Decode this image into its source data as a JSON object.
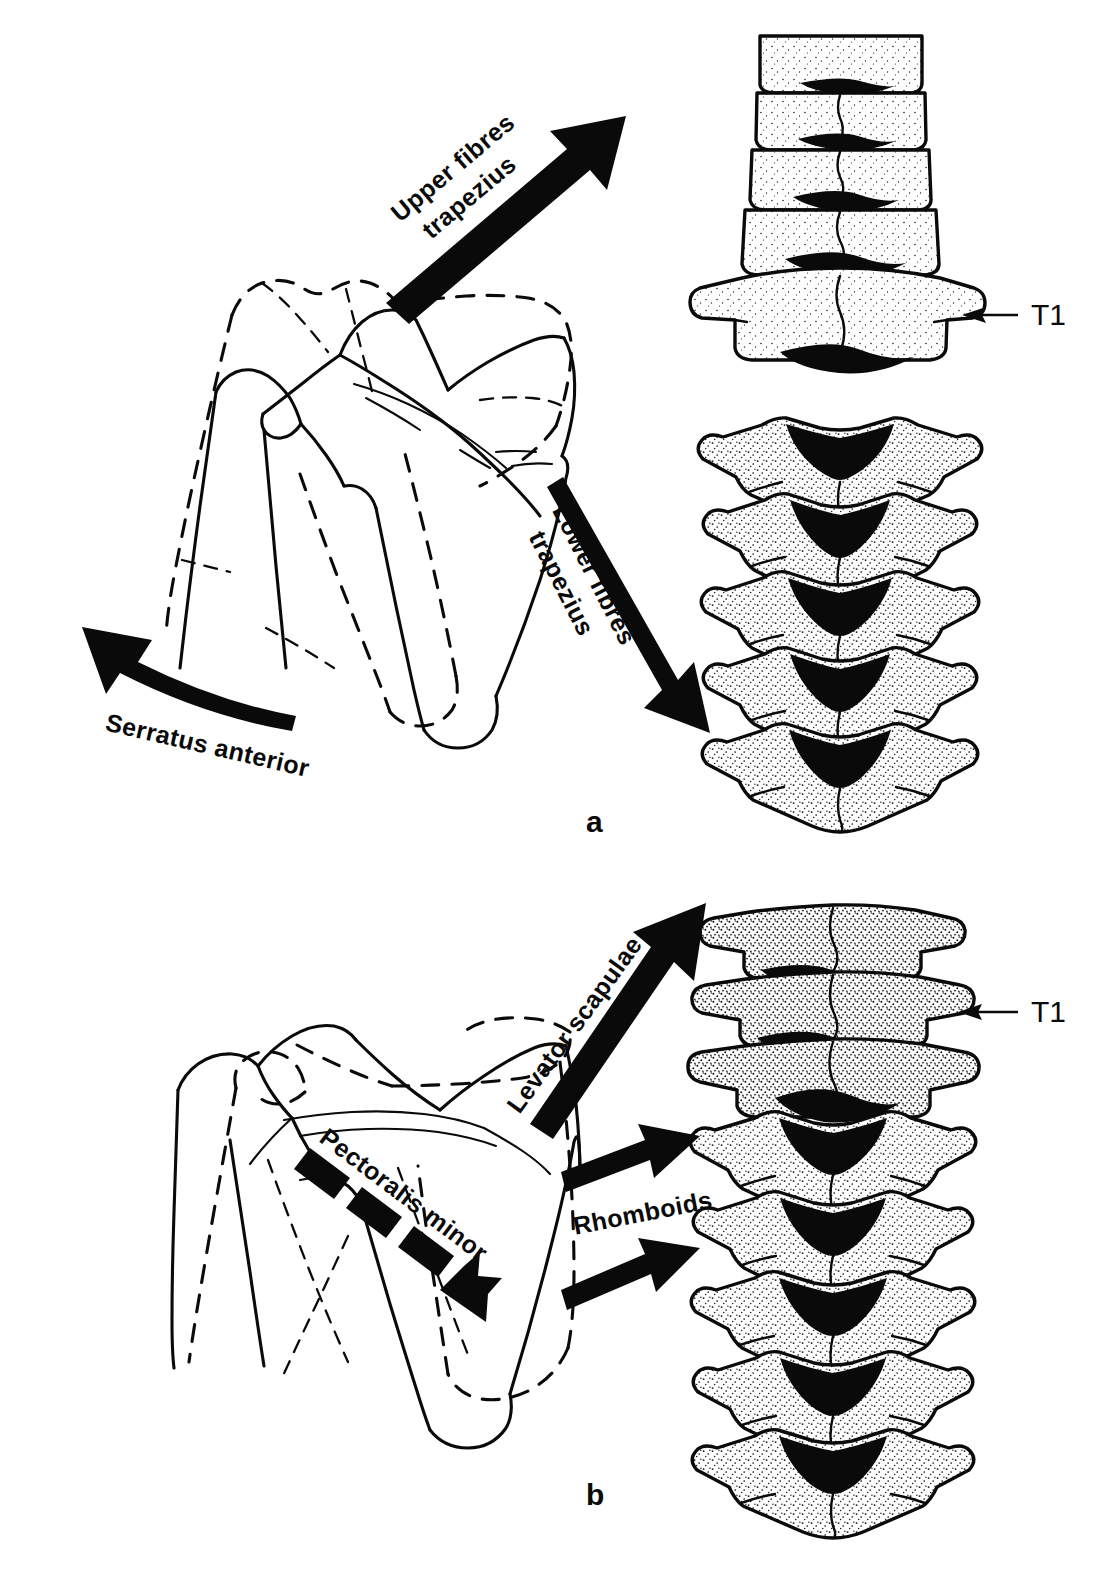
{
  "figure": {
    "type": "anatomical-line-drawing",
    "background_color": "#ffffff",
    "ink_color": "#0a0a0a"
  },
  "panels": [
    {
      "id": "a",
      "panel_label": "a",
      "scapula_view": "posterior right scapula with dashed outline showing displaced position",
      "spine_label": "T1",
      "muscle_arrows": [
        {
          "label": "Upper fibres trapezius",
          "direction": "up-and-right",
          "style": "solid thick arrow",
          "label_line_1": "Upper fibres",
          "label_line_2": "trapezius"
        },
        {
          "label": "Lower fibres trapezius",
          "direction": "down-and-right",
          "style": "solid thick arrow",
          "label_line_1": "Lower fibres",
          "label_line_2": "trapezius"
        },
        {
          "label": "Serratus anterior",
          "direction": "curved up-and-left",
          "style": "solid curved thick arrow",
          "label_line_1": "Serratus anterior",
          "label_line_2": ""
        }
      ]
    },
    {
      "id": "b",
      "panel_label": "b",
      "scapula_view": "posterior right scapula with dashed outline showing displaced position",
      "spine_label": "T1",
      "muscle_arrows": [
        {
          "label": "Levator scapulae",
          "direction": "up-and-right",
          "style": "solid thick arrow",
          "label_line_1": "Levator scapulae",
          "label_line_2": ""
        },
        {
          "label": "Rhomboids",
          "direction": "right (two parallel arrows)",
          "style": "solid thick arrows",
          "label_line_1": "Rhomboids",
          "label_line_2": ""
        },
        {
          "label": "Pectoralis minor",
          "direction": "down-and-right",
          "style": "dashed thick arrow",
          "label_line_1": "Pectoralis minor",
          "label_line_2": ""
        }
      ]
    }
  ],
  "labels": {
    "upper_fibres_line1": "Upper fibres",
    "upper_fibres_line2": "trapezius",
    "lower_fibres_line1": "Lower fibres",
    "lower_fibres_line2": "trapezius",
    "serratus_anterior": "Serratus anterior",
    "levator_scapulae": "Levator scapulae",
    "rhomboids": "Rhomboids",
    "pectoralis_minor": "Pectoralis minor",
    "t1_top": "T1",
    "t1_bottom": "T1",
    "panel_a": "a",
    "panel_b": "b"
  }
}
